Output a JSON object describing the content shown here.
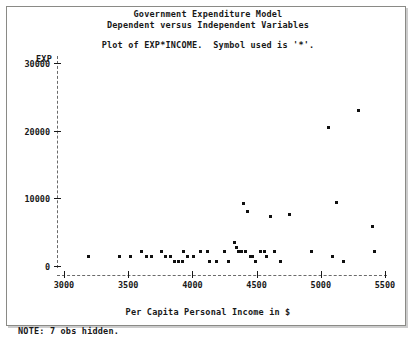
{
  "window": {
    "background_color": "#c8c8c4",
    "panel_color": "#ffffff",
    "border_color": "#8a8a86"
  },
  "header": {
    "title_line1": "Government Expenditure Model",
    "title_line2": "Dependent versus Independent Variables",
    "subtitle": "Plot of EXP*INCOME.  Symbol used is '*'."
  },
  "footer": {
    "note": "NOTE: 7 obs hidden."
  },
  "chart_data": {
    "type": "scatter",
    "title": "Government Expenditure Model",
    "subtitle": "Dependent versus Independent Variables",
    "plot_statement": "Plot of EXP*INCOME.  Symbol used is '*'.",
    "symbol": "*",
    "xlabel": "Per Capita Personal Income in $",
    "ylabel": "EXP",
    "xlim": [
      3000,
      5500
    ],
    "ylim": [
      0,
      30000
    ],
    "xticks": [
      3000,
      3500,
      4000,
      4500,
      5000,
      5500
    ],
    "yticks": [
      0,
      10000,
      20000,
      30000
    ],
    "xtick_labels": [
      "3000",
      "3500",
      "4000",
      "4500",
      "5000",
      "5500"
    ],
    "ytick_labels": [
      "0",
      "10000",
      "20000",
      "30000"
    ],
    "grid": false,
    "legend": null,
    "hidden_observations": 7,
    "series": [
      {
        "name": "EXP vs INCOME",
        "color": "#101010",
        "points": [
          [
            3190,
            1400
          ],
          [
            3430,
            1400
          ],
          [
            3520,
            1400
          ],
          [
            3600,
            2100
          ],
          [
            3640,
            1400
          ],
          [
            3680,
            1400
          ],
          [
            3760,
            2100
          ],
          [
            3790,
            1400
          ],
          [
            3830,
            1400
          ],
          [
            3860,
            700
          ],
          [
            3890,
            700
          ],
          [
            3920,
            700
          ],
          [
            3930,
            2100
          ],
          [
            3960,
            1400
          ],
          [
            4010,
            1400
          ],
          [
            4060,
            2100
          ],
          [
            4120,
            2100
          ],
          [
            4130,
            700
          ],
          [
            4190,
            700
          ],
          [
            4250,
            2100
          ],
          [
            4280,
            700
          ],
          [
            4330,
            3400
          ],
          [
            4340,
            2800
          ],
          [
            4360,
            2100
          ],
          [
            4380,
            2100
          ],
          [
            4400,
            9200
          ],
          [
            4410,
            2100
          ],
          [
            4430,
            8100
          ],
          [
            4450,
            1400
          ],
          [
            4470,
            1400
          ],
          [
            4490,
            700
          ],
          [
            4530,
            2100
          ],
          [
            4560,
            2100
          ],
          [
            4580,
            1400
          ],
          [
            4610,
            7300
          ],
          [
            4640,
            2100
          ],
          [
            4690,
            700
          ],
          [
            4760,
            7600
          ],
          [
            4930,
            2100
          ],
          [
            5060,
            20400
          ],
          [
            5090,
            1400
          ],
          [
            5120,
            9400
          ],
          [
            5180,
            700
          ],
          [
            5290,
            23000
          ],
          [
            5400,
            5800
          ],
          [
            5420,
            2100
          ]
        ]
      }
    ]
  },
  "axes": {
    "y_axis_name": "y-axis",
    "x_axis_name": "x-axis"
  }
}
